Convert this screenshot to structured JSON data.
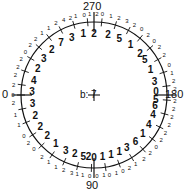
{
  "diagram": {
    "center_label": "b: 7",
    "center": {
      "x": 94,
      "y": 95
    },
    "radius": 73,
    "axis_labels": {
      "top": "270",
      "right": "180",
      "bottom": "90",
      "left": "0"
    },
    "inner_ring": [
      {
        "angle": 270,
        "text": "2"
      },
      {
        "angle": 280,
        "text": "1"
      },
      {
        "angle": 291,
        "text": "3"
      },
      {
        "angle": 302,
        "text": "7"
      },
      {
        "angle": 313,
        "text": "2"
      },
      {
        "angle": 324,
        "text": "3"
      },
      {
        "angle": 335,
        "text": "2"
      },
      {
        "angle": 346,
        "text": "4"
      },
      {
        "angle": 357,
        "text": "3"
      },
      {
        "angle": 8,
        "text": "3"
      },
      {
        "angle": 19,
        "text": "2"
      },
      {
        "angle": 30,
        "text": "2"
      },
      {
        "angle": 41,
        "text": "2"
      },
      {
        "angle": 52,
        "text": "1"
      },
      {
        "angle": 63,
        "text": "3"
      },
      {
        "angle": 72,
        "text": "2"
      },
      {
        "angle": 80,
        "text": "5"
      },
      {
        "angle": 85,
        "text": "2"
      },
      {
        "angle": 90,
        "text": "0"
      },
      {
        "angle": 98,
        "text": "1"
      },
      {
        "angle": 106,
        "text": "1"
      },
      {
        "angle": 114,
        "text": "1"
      },
      {
        "angle": 122,
        "text": "3"
      },
      {
        "angle": 132,
        "text": "6"
      },
      {
        "angle": 142,
        "text": "1"
      },
      {
        "angle": 152,
        "text": "4"
      },
      {
        "angle": 162,
        "text": "4"
      },
      {
        "angle": 170,
        "text": "6"
      },
      {
        "angle": 176,
        "text": "5"
      },
      {
        "angle": 183,
        "text": "0"
      },
      {
        "angle": 193,
        "text": "3"
      },
      {
        "angle": 204,
        "text": "1"
      },
      {
        "angle": 215,
        "text": "5"
      },
      {
        "angle": 222,
        "text": "2"
      },
      {
        "angle": 234,
        "text": "1"
      },
      {
        "angle": 246,
        "text": "5"
      },
      {
        "angle": 257,
        "text": "2"
      }
    ],
    "outer_ring": [
      {
        "angle": 264,
        "text": "0"
      },
      {
        "angle": 268,
        "text": "2"
      },
      {
        "angle": 273,
        "text": "1"
      },
      {
        "angle": 277,
        "text": "0"
      },
      {
        "angle": 283,
        "text": "1"
      },
      {
        "angle": 287,
        "text": "2"
      },
      {
        "angle": 292,
        "text": "4"
      },
      {
        "angle": 298,
        "text": "2"
      },
      {
        "angle": 304,
        "text": "1"
      },
      {
        "angle": 310,
        "text": "1"
      },
      {
        "angle": 316,
        "text": "2"
      },
      {
        "angle": 322,
        "text": "2"
      },
      {
        "angle": 328,
        "text": "0"
      },
      {
        "angle": 334,
        "text": "2"
      },
      {
        "angle": 340,
        "text": "2"
      },
      {
        "angle": 346,
        "text": "2"
      },
      {
        "angle": 353,
        "text": "2"
      },
      {
        "angle": 0,
        "text": "0"
      },
      {
        "angle": 6,
        "text": "2"
      },
      {
        "angle": 14,
        "text": "1"
      },
      {
        "angle": 22,
        "text": "1"
      },
      {
        "angle": 30,
        "text": "0"
      },
      {
        "angle": 36,
        "text": "2"
      },
      {
        "angle": 42,
        "text": "0"
      },
      {
        "angle": 50,
        "text": "2"
      },
      {
        "angle": 56,
        "text": "1"
      },
      {
        "angle": 62,
        "text": "1"
      },
      {
        "angle": 68,
        "text": "2"
      },
      {
        "angle": 74,
        "text": "3"
      },
      {
        "angle": 78,
        "text": "1"
      },
      {
        "angle": 82,
        "text": "1"
      },
      {
        "angle": 87,
        "text": "0"
      },
      {
        "angle": 92,
        "text": "0"
      },
      {
        "angle": 97,
        "text": "1"
      },
      {
        "angle": 101,
        "text": "0"
      },
      {
        "angle": 106,
        "text": "1"
      },
      {
        "angle": 111,
        "text": "0"
      },
      {
        "angle": 116,
        "text": "2"
      },
      {
        "angle": 121,
        "text": "1"
      },
      {
        "angle": 128,
        "text": "2"
      },
      {
        "angle": 134,
        "text": "2"
      },
      {
        "angle": 140,
        "text": "0"
      },
      {
        "angle": 146,
        "text": "2"
      },
      {
        "angle": 152,
        "text": "2"
      },
      {
        "angle": 158,
        "text": "2"
      },
      {
        "angle": 164,
        "text": "2"
      },
      {
        "angle": 170,
        "text": "2"
      },
      {
        "angle": 176,
        "text": "2"
      },
      {
        "angle": 184,
        "text": "2"
      },
      {
        "angle": 190,
        "text": "2"
      },
      {
        "angle": 196,
        "text": "1"
      },
      {
        "angle": 202,
        "text": "0"
      },
      {
        "angle": 210,
        "text": "2"
      },
      {
        "angle": 216,
        "text": "2"
      },
      {
        "angle": 222,
        "text": "0"
      },
      {
        "angle": 228,
        "text": "2"
      },
      {
        "angle": 234,
        "text": "0"
      },
      {
        "angle": 240,
        "text": "2"
      },
      {
        "angle": 246,
        "text": "3"
      },
      {
        "angle": 252,
        "text": "2"
      },
      {
        "angle": 258,
        "text": "1"
      }
    ]
  }
}
